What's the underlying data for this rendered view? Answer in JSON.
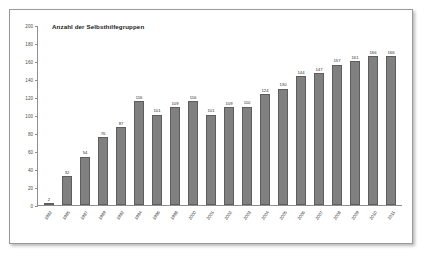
{
  "chart_data": {
    "type": "bar",
    "title": "Anzahl der Selbsthilfegruppen",
    "xlabel": "",
    "ylabel": "",
    "ylim": [
      0,
      200
    ],
    "yticks": [
      0,
      20,
      40,
      60,
      80,
      100,
      120,
      140,
      160,
      180,
      200
    ],
    "grid": false,
    "legend": false,
    "categories": [
      "1982",
      "1985",
      "1987",
      "1989",
      "1992",
      "1994",
      "1996",
      "1998",
      "2000",
      "2001",
      "2002",
      "2003",
      "2004",
      "2005",
      "2006",
      "2007",
      "2008",
      "2009",
      "2010",
      "2011"
    ],
    "values": [
      2,
      32,
      54,
      76,
      87,
      116,
      101,
      109,
      116,
      101,
      109,
      110,
      124,
      130,
      144,
      147,
      157,
      161,
      166,
      166
    ],
    "bar_color": "#808080",
    "bar_border_color": "#5d5d5d",
    "axis_color": "#8e8e8e",
    "background": "#ffffff"
  }
}
